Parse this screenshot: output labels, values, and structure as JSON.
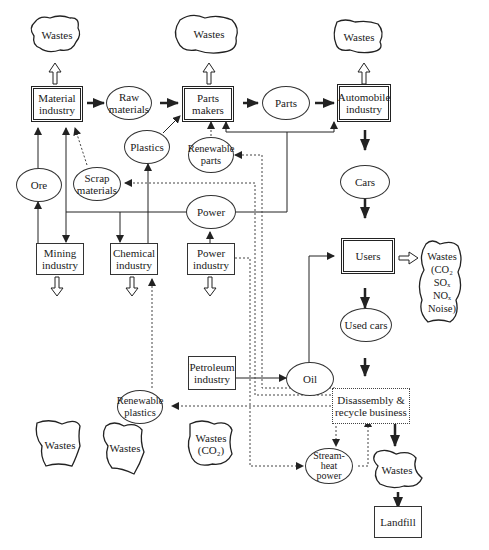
{
  "diagram": {
    "type": "flow",
    "title": "",
    "nodes": {
      "wastes_material": {
        "label": "Wastes",
        "shape": "cloud"
      },
      "wastes_parts": {
        "label": "Wastes",
        "shape": "cloud"
      },
      "wastes_auto": {
        "label": "Wastes",
        "shape": "cloud"
      },
      "material_industry": {
        "label": "Material\nindustry",
        "shape": "double-box"
      },
      "raw_materials": {
        "label": "Raw\nmaterials",
        "shape": "ellipse"
      },
      "parts_makers": {
        "label": "Parts\nmakers",
        "shape": "double-box"
      },
      "parts": {
        "label": "Parts",
        "shape": "ellipse"
      },
      "automobile_industry": {
        "label": "Automobile\nindustry",
        "shape": "double-box"
      },
      "plastics": {
        "label": "Plastics",
        "shape": "ellipse"
      },
      "renewable_parts": {
        "label": "Renewable\nparts",
        "shape": "ellipse"
      },
      "ore": {
        "label": "Ore",
        "shape": "ellipse"
      },
      "scrap_materials": {
        "label": "Scrap\nmaterials",
        "shape": "ellipse"
      },
      "power": {
        "label": "Power",
        "shape": "ellipse"
      },
      "cars": {
        "label": "Cars",
        "shape": "ellipse"
      },
      "mining_industry": {
        "label": "Mining\nindustry",
        "shape": "box"
      },
      "chemical_industry": {
        "label": "Chemical\nindustry",
        "shape": "box"
      },
      "power_industry": {
        "label": "Power\nindustry",
        "shape": "box"
      },
      "users": {
        "label": "Users",
        "shape": "double-box"
      },
      "wastes_users": {
        "label": "Wastes\n(CO₂\nSOₓ\nNOₓ\nNoise)",
        "shape": "cloud"
      },
      "wastes_mining": {
        "label": "Wastes",
        "shape": "cloud"
      },
      "wastes_chemical": {
        "label": "Wastes",
        "shape": "cloud"
      },
      "wastes_power": {
        "label": "Wastes\n(CO₂)",
        "shape": "cloud"
      },
      "used_cars": {
        "label": "Used cars",
        "shape": "ellipse"
      },
      "petroleum_industry": {
        "label": "Petroleum\nindustry",
        "shape": "box"
      },
      "oil": {
        "label": "Oil",
        "shape": "ellipse"
      },
      "renewable_plastics": {
        "label": "Renewable\nplastics",
        "shape": "ellipse"
      },
      "disassembly": {
        "label": "Disassembly &\nrecycle business",
        "shape": "dotted-box"
      },
      "stream_heat_power": {
        "label": "Stream-\nheat\npower",
        "shape": "ellipse"
      },
      "wastes_disassembly": {
        "label": "Wastes",
        "shape": "cloud"
      },
      "landfill": {
        "label": "Landfill",
        "shape": "box"
      }
    },
    "edges": [
      {
        "from": "material_industry",
        "to": "wastes_material",
        "style": "hollow"
      },
      {
        "from": "parts_makers",
        "to": "wastes_parts",
        "style": "hollow"
      },
      {
        "from": "automobile_industry",
        "to": "wastes_auto",
        "style": "hollow"
      },
      {
        "from": "material_industry",
        "to": "raw_materials",
        "style": "bold"
      },
      {
        "from": "raw_materials",
        "to": "parts_makers",
        "style": "bold"
      },
      {
        "from": "parts_makers",
        "to": "parts",
        "style": "bold"
      },
      {
        "from": "parts",
        "to": "automobile_industry",
        "style": "bold"
      },
      {
        "from": "plastics",
        "to": "parts_makers",
        "style": "solid"
      },
      {
        "from": "renewable_parts",
        "to": "parts_makers",
        "style": "dotted"
      },
      {
        "from": "ore",
        "to": "material_industry",
        "style": "solid"
      },
      {
        "from": "scrap_materials",
        "to": "material_industry",
        "style": "dotted"
      },
      {
        "from": "mining_industry",
        "to": "ore",
        "style": "solid"
      },
      {
        "from": "power",
        "to": "material_industry",
        "style": "solid"
      },
      {
        "from": "power",
        "to": "mining_industry",
        "style": "solid"
      },
      {
        "from": "power",
        "to": "chemical_industry",
        "style": "solid"
      },
      {
        "from": "power",
        "to": "parts_makers",
        "style": "solid"
      },
      {
        "from": "power",
        "to": "automobile_industry",
        "style": "solid"
      },
      {
        "from": "chemical_industry",
        "to": "plastics",
        "style": "solid"
      },
      {
        "from": "power_industry",
        "to": "power",
        "style": "solid"
      },
      {
        "from": "automobile_industry",
        "to": "cars",
        "style": "bold"
      },
      {
        "from": "cars",
        "to": "users",
        "style": "bold"
      },
      {
        "from": "users",
        "to": "wastes_users",
        "style": "hollow"
      },
      {
        "from": "users",
        "to": "used_cars",
        "style": "bold"
      },
      {
        "from": "used_cars",
        "to": "disassembly",
        "style": "bold"
      },
      {
        "from": "mining_industry",
        "to": "wastes_mining",
        "style": "hollow"
      },
      {
        "from": "chemical_industry",
        "to": "wastes_chemical",
        "style": "hollow"
      },
      {
        "from": "power_industry",
        "to": "wastes_power",
        "style": "hollow"
      },
      {
        "from": "petroleum_industry",
        "to": "oil",
        "style": "solid"
      },
      {
        "from": "oil",
        "to": "users",
        "style": "solid"
      },
      {
        "from": "disassembly",
        "to": "scrap_materials",
        "style": "dotted"
      },
      {
        "from": "disassembly",
        "to": "renewable_parts",
        "style": "dotted"
      },
      {
        "from": "disassembly",
        "to": "renewable_plastics",
        "style": "dotted"
      },
      {
        "from": "renewable_plastics",
        "to": "chemical_industry",
        "style": "dotted"
      },
      {
        "from": "disassembly",
        "to": "stream_heat_power",
        "style": "dotted"
      },
      {
        "from": "power_industry",
        "to": "stream_heat_power",
        "style": "dotted"
      },
      {
        "from": "stream_heat_power",
        "to": "disassembly",
        "style": "dotted"
      },
      {
        "from": "disassembly",
        "to": "wastes_disassembly",
        "style": "bold"
      },
      {
        "from": "wastes_disassembly",
        "to": "landfill",
        "style": "bold"
      }
    ]
  }
}
